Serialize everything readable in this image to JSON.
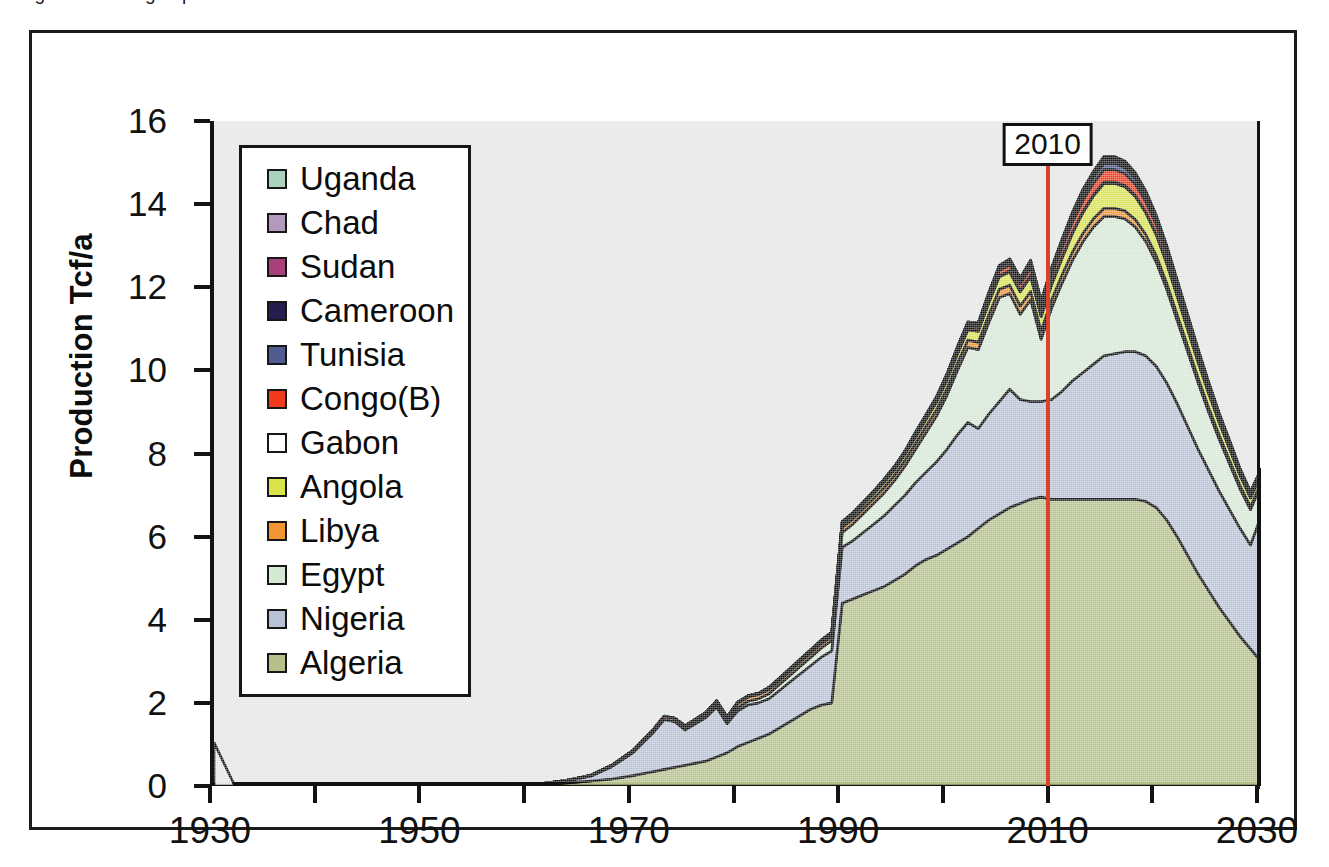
{
  "caption": {
    "clipped_text": "Figure   African gas production"
  },
  "axes": {
    "y_title": "Production Tcf/a",
    "y_ticks": [
      0,
      2,
      4,
      6,
      8,
      10,
      12,
      14,
      16
    ],
    "y_min": 0,
    "y_max": 16,
    "x_ticks_labeled": [
      1930,
      1950,
      1970,
      1990,
      2010,
      2030
    ],
    "x_ticks_all": [
      1930,
      1940,
      1950,
      1960,
      1970,
      1980,
      1990,
      2000,
      2010,
      2020,
      2030
    ],
    "x_min": 1930,
    "x_max": 2030
  },
  "marker": {
    "label": "2010",
    "year": 2010,
    "color": "#d9432a"
  },
  "legend": {
    "items": [
      {
        "label": "Uganda",
        "color": "#a9d3bb"
      },
      {
        "label": "Chad",
        "color": "#b399bd"
      },
      {
        "label": "Sudan",
        "color": "#a8407a"
      },
      {
        "label": "Cameroon",
        "color": "#241d4e"
      },
      {
        "label": "Tunisia",
        "color": "#515c90"
      },
      {
        "label": "Congo(B)",
        "color": "#ef3b1c"
      },
      {
        "label": "Gabon",
        "color": "#ffffff"
      },
      {
        "label": "Angola",
        "color": "#d9e34a"
      },
      {
        "label": "Libya",
        "color": "#f09434"
      },
      {
        "label": "Egypt",
        "color": "#d5e8d4"
      },
      {
        "label": "Nigeria",
        "color": "#b8c2d6"
      },
      {
        "label": "Algeria",
        "color": "#b5c189"
      }
    ]
  },
  "chart_data": {
    "type": "area",
    "xlabel": "",
    "ylabel": "Production Tcf/a",
    "xlim": [
      1930,
      2030
    ],
    "ylim": [
      0,
      16
    ],
    "grid": false,
    "legend_position": "upper-left-inside",
    "stacked": true,
    "note": "Stacked area, bottom-to-top order: Algeria, Nigeria, Egypt, Libya, Angola, Gabon, Congo(B), Tunisia, Cameroon, Sudan, Chad, Uganda. Red vertical line marks 2010 (history/forecast divide).",
    "x": [
      1930,
      1935,
      1940,
      1945,
      1950,
      1955,
      1960,
      1962,
      1964,
      1966,
      1968,
      1970,
      1971,
      1972,
      1973,
      1974,
      1975,
      1976,
      1977,
      1978,
      1979,
      1980,
      1981,
      1982,
      1983,
      1984,
      1985,
      1986,
      1987,
      1988,
      1989,
      1990,
      1991,
      1992,
      1993,
      1994,
      1995,
      1996,
      1997,
      1998,
      1999,
      2000,
      2001,
      2002,
      2003,
      2004,
      2005,
      2006,
      2007,
      2008,
      2009,
      2010,
      2011,
      2012,
      2013,
      2014,
      2015,
      2016,
      2017,
      2018,
      2019,
      2020,
      2021,
      2022,
      2023,
      2024,
      2025,
      2026,
      2027,
      2028,
      2029,
      2030
    ],
    "series": [
      {
        "name": "Algeria",
        "color": "#b5c189",
        "values": [
          0,
          0,
          0,
          0,
          0,
          0,
          0.02,
          0.05,
          0.08,
          0.12,
          0.17,
          0.25,
          0.3,
          0.35,
          0.4,
          0.45,
          0.5,
          0.55,
          0.6,
          0.7,
          0.8,
          0.95,
          1.05,
          1.15,
          1.25,
          1.4,
          1.55,
          1.7,
          1.85,
          1.95,
          2.0,
          4.4,
          4.5,
          4.6,
          4.7,
          4.8,
          4.95,
          5.1,
          5.3,
          5.45,
          5.55,
          5.7,
          5.85,
          6.0,
          6.2,
          6.4,
          6.55,
          6.7,
          6.8,
          6.9,
          6.95,
          6.9,
          6.9,
          6.9,
          6.9,
          6.9,
          6.9,
          6.9,
          6.9,
          6.9,
          6.85,
          6.7,
          6.4,
          6.0,
          5.55,
          5.1,
          4.7,
          4.3,
          3.95,
          3.6,
          3.3,
          3.0
        ]
      },
      {
        "name": "Nigeria",
        "color": "#b8c2d6",
        "values": [
          0,
          0,
          0,
          0,
          0,
          0,
          0.01,
          0.03,
          0.06,
          0.12,
          0.3,
          0.55,
          0.75,
          0.95,
          1.2,
          1.1,
          0.85,
          0.95,
          1.05,
          1.2,
          0.7,
          0.85,
          0.9,
          0.85,
          0.85,
          0.9,
          0.95,
          1.0,
          1.05,
          1.15,
          1.25,
          1.35,
          1.4,
          1.5,
          1.6,
          1.7,
          1.8,
          1.9,
          2.0,
          2.1,
          2.25,
          2.4,
          2.6,
          2.75,
          2.4,
          2.55,
          2.7,
          2.85,
          2.5,
          2.35,
          2.3,
          2.4,
          2.6,
          2.85,
          3.05,
          3.25,
          3.45,
          3.5,
          3.55,
          3.55,
          3.5,
          3.4,
          3.3,
          3.2,
          3.1,
          3.0,
          2.9,
          2.8,
          2.7,
          2.6,
          2.5,
          3.5
        ]
      },
      {
        "name": "Egypt",
        "color": "#d5e8d4",
        "values": [
          0,
          0,
          0,
          0,
          0,
          0,
          0,
          0,
          0,
          0,
          0,
          0,
          0,
          0,
          0,
          0,
          0.02,
          0.03,
          0.04,
          0.05,
          0.06,
          0.08,
          0.09,
          0.1,
          0.12,
          0.14,
          0.16,
          0.18,
          0.2,
          0.22,
          0.25,
          0.35,
          0.4,
          0.45,
          0.5,
          0.55,
          0.6,
          0.7,
          0.8,
          0.95,
          1.1,
          1.3,
          1.55,
          1.8,
          1.9,
          2.2,
          2.5,
          2.3,
          2.05,
          2.45,
          1.5,
          2.2,
          2.6,
          2.9,
          3.15,
          3.3,
          3.35,
          3.3,
          3.2,
          3.0,
          2.75,
          2.5,
          2.25,
          2.0,
          1.8,
          1.6,
          1.4,
          1.25,
          1.1,
          0.95,
          0.85,
          0.75
        ]
      },
      {
        "name": "Libya",
        "color": "#f09434",
        "values": [
          0,
          0,
          0,
          0,
          0,
          0,
          0,
          0,
          0.01,
          0.02,
          0.03,
          0.05,
          0.06,
          0.07,
          0.08,
          0.08,
          0.08,
          0.08,
          0.08,
          0.09,
          0.09,
          0.1,
          0.1,
          0.1,
          0.1,
          0.1,
          0.1,
          0.1,
          0.1,
          0.1,
          0.1,
          0.12,
          0.12,
          0.12,
          0.12,
          0.13,
          0.13,
          0.14,
          0.14,
          0.15,
          0.15,
          0.16,
          0.17,
          0.18,
          0.18,
          0.19,
          0.2,
          0.2,
          0.2,
          0.2,
          0.2,
          0.2,
          0.2,
          0.2,
          0.2,
          0.2,
          0.2,
          0.2,
          0.19,
          0.18,
          0.17,
          0.16,
          0.15,
          0.14,
          0.13,
          0.12,
          0.11,
          0.1,
          0.09,
          0.08,
          0.07,
          0.06
        ]
      },
      {
        "name": "Angola",
        "color": "#d9e34a",
        "values": [
          0,
          0,
          0,
          0,
          0,
          0,
          0,
          0,
          0,
          0,
          0,
          0,
          0,
          0,
          0,
          0,
          0,
          0,
          0,
          0.01,
          0.01,
          0.02,
          0.02,
          0.02,
          0.03,
          0.03,
          0.04,
          0.04,
          0.05,
          0.05,
          0.06,
          0.08,
          0.09,
          0.1,
          0.11,
          0.12,
          0.13,
          0.14,
          0.15,
          0.16,
          0.18,
          0.2,
          0.22,
          0.24,
          0.26,
          0.28,
          0.3,
          0.32,
          0.34,
          0.36,
          0.34,
          0.36,
          0.4,
          0.45,
          0.5,
          0.55,
          0.6,
          0.6,
          0.58,
          0.55,
          0.52,
          0.5,
          0.47,
          0.44,
          0.4,
          0.37,
          0.34,
          0.3,
          0.27,
          0.24,
          0.21,
          0.18
        ]
      },
      {
        "name": "Gabon",
        "color": "#ffffff",
        "values": [
          0,
          0,
          0,
          0,
          0,
          0,
          0,
          0,
          0,
          0,
          0,
          0,
          0,
          0,
          0,
          0,
          0,
          0,
          0,
          0,
          0,
          0.01,
          0.01,
          0.01,
          0.01,
          0.01,
          0.01,
          0.01,
          0.01,
          0.02,
          0.02,
          0.02,
          0.02,
          0.02,
          0.02,
          0.02,
          0.02,
          0.02,
          0.03,
          0.03,
          0.03,
          0.03,
          0.03,
          0.03,
          0.03,
          0.03,
          0.03,
          0.03,
          0.03,
          0.03,
          0.03,
          0.03,
          0.03,
          0.03,
          0.03,
          0.03,
          0.03,
          0.03,
          0.03,
          0.03,
          0.02,
          0.02,
          0.02,
          0.02,
          0.02,
          0.02,
          0.01,
          0.01,
          0.01,
          0.01,
          0.01,
          0.01
        ]
      },
      {
        "name": "Congo(B)",
        "color": "#ef3b1c",
        "values": [
          0,
          0,
          0,
          0,
          0,
          0,
          0,
          0,
          0,
          0,
          0,
          0,
          0,
          0,
          0,
          0,
          0,
          0,
          0,
          0,
          0,
          0,
          0,
          0,
          0,
          0,
          0,
          0,
          0,
          0,
          0,
          0.01,
          0.01,
          0.01,
          0.01,
          0.02,
          0.02,
          0.02,
          0.03,
          0.03,
          0.04,
          0.05,
          0.06,
          0.07,
          0.08,
          0.1,
          0.12,
          0.14,
          0.16,
          0.18,
          0.18,
          0.2,
          0.22,
          0.24,
          0.26,
          0.28,
          0.3,
          0.3,
          0.29,
          0.27,
          0.25,
          0.23,
          0.21,
          0.19,
          0.17,
          0.15,
          0.13,
          0.11,
          0.1,
          0.08,
          0.07,
          0.06
        ]
      },
      {
        "name": "Tunisia",
        "color": "#515c90",
        "values": [
          0,
          0,
          0,
          0,
          0,
          0,
          0,
          0,
          0,
          0,
          0,
          0,
          0,
          0,
          0,
          0,
          0,
          0,
          0,
          0,
          0,
          0,
          0,
          0,
          0.01,
          0.01,
          0.01,
          0.02,
          0.02,
          0.02,
          0.02,
          0.03,
          0.03,
          0.03,
          0.03,
          0.04,
          0.04,
          0.04,
          0.05,
          0.05,
          0.05,
          0.06,
          0.06,
          0.07,
          0.07,
          0.08,
          0.08,
          0.09,
          0.09,
          0.1,
          0.1,
          0.1,
          0.11,
          0.12,
          0.13,
          0.14,
          0.15,
          0.15,
          0.14,
          0.13,
          0.12,
          0.11,
          0.1,
          0.09,
          0.08,
          0.07,
          0.06,
          0.05,
          0.05,
          0.04,
          0.04,
          0.03
        ]
      },
      {
        "name": "Cameroon",
        "color": "#241d4e",
        "values": [
          0,
          0,
          0,
          0,
          0,
          0,
          0,
          0,
          0,
          0,
          0,
          0,
          0,
          0,
          0,
          0,
          0,
          0,
          0,
          0,
          0,
          0,
          0,
          0,
          0,
          0,
          0,
          0,
          0,
          0,
          0,
          0,
          0,
          0,
          0,
          0,
          0,
          0,
          0.01,
          0.01,
          0.01,
          0.01,
          0.02,
          0.02,
          0.02,
          0.03,
          0.03,
          0.04,
          0.04,
          0.05,
          0.05,
          0.05,
          0.06,
          0.07,
          0.08,
          0.08,
          0.09,
          0.09,
          0.08,
          0.08,
          0.07,
          0.06,
          0.06,
          0.05,
          0.05,
          0.04,
          0.04,
          0.03,
          0.03,
          0.02,
          0.02,
          0.02
        ]
      },
      {
        "name": "Sudan",
        "color": "#a8407a",
        "values": [
          0,
          0,
          0,
          0,
          0,
          0,
          0,
          0,
          0,
          0,
          0,
          0,
          0,
          0,
          0,
          0,
          0,
          0,
          0,
          0,
          0,
          0,
          0,
          0,
          0,
          0,
          0,
          0,
          0,
          0,
          0,
          0,
          0,
          0,
          0,
          0,
          0,
          0,
          0,
          0,
          0,
          0,
          0,
          0,
          0,
          0.01,
          0.01,
          0.01,
          0.01,
          0.02,
          0.02,
          0.02,
          0.02,
          0.03,
          0.03,
          0.03,
          0.04,
          0.04,
          0.04,
          0.03,
          0.03,
          0.03,
          0.02,
          0.02,
          0.02,
          0.02,
          0.01,
          0.01,
          0.01,
          0.01,
          0.01,
          0.01
        ]
      },
      {
        "name": "Chad",
        "color": "#b399bd",
        "values": [
          0,
          0,
          0,
          0,
          0,
          0,
          0,
          0,
          0,
          0,
          0,
          0,
          0,
          0,
          0,
          0,
          0,
          0,
          0,
          0,
          0,
          0,
          0,
          0,
          0,
          0,
          0,
          0,
          0,
          0,
          0,
          0,
          0,
          0,
          0,
          0,
          0,
          0,
          0,
          0,
          0,
          0,
          0,
          0,
          0,
          0,
          0,
          0,
          0,
          0.01,
          0.01,
          0.01,
          0.01,
          0.01,
          0.02,
          0.02,
          0.02,
          0.02,
          0.02,
          0.02,
          0.02,
          0.01,
          0.01,
          0.01,
          0.01,
          0.01,
          0.01,
          0.01,
          0,
          0,
          0,
          0
        ]
      },
      {
        "name": "Uganda",
        "color": "#a9d3bb",
        "values": [
          0,
          0,
          0,
          0,
          0,
          0,
          0,
          0,
          0,
          0,
          0,
          0,
          0,
          0,
          0,
          0,
          0,
          0,
          0,
          0,
          0,
          0,
          0,
          0,
          0,
          0,
          0,
          0,
          0,
          0,
          0,
          0,
          0,
          0,
          0,
          0,
          0,
          0,
          0,
          0,
          0,
          0,
          0,
          0,
          0,
          0,
          0,
          0,
          0,
          0,
          0,
          0,
          0.01,
          0.01,
          0.01,
          0.01,
          0.02,
          0.02,
          0.02,
          0.02,
          0.02,
          0.01,
          0.01,
          0.01,
          0.01,
          0.01,
          0.01,
          0.01,
          0,
          0,
          0,
          0
        ]
      }
    ]
  }
}
